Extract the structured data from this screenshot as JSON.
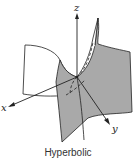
{
  "figure": {
    "caption": "Hyperbolic",
    "surface_name": "hyperbolic-paraboloid",
    "axes": {
      "x_label": "x",
      "y_label": "y",
      "z_label": "z"
    },
    "colors": {
      "surface_fill": "#a9a9a9",
      "surface_edge": "#222222",
      "flap_fill": "#ffffff",
      "axis": "#222222"
    }
  }
}
